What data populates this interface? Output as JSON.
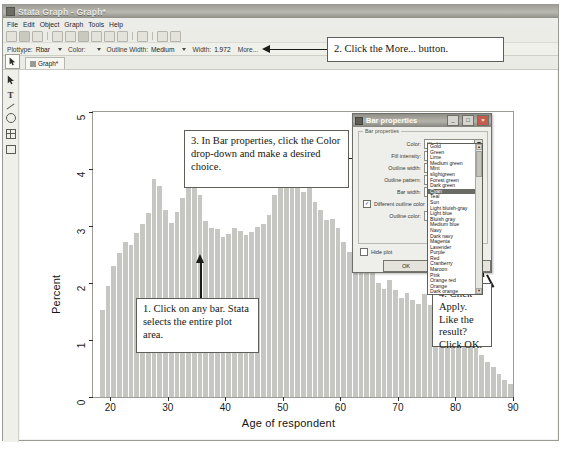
{
  "window": {
    "title": "Stata Graph - Graph*",
    "menu": [
      "File",
      "Edit",
      "Object",
      "Graph",
      "Tools",
      "Help"
    ],
    "tab_label": "Graph*",
    "pointer_icon": "arrow-cursor-icon",
    "left_tools": [
      "pointer-tool",
      "text-tool",
      "line-tool",
      "rect-tool",
      "ellipse-tool",
      "grid-tool"
    ]
  },
  "propbar": {
    "plottype_label": "Plottype:",
    "plottype_value": "Rbar",
    "color_label": "Color:",
    "color_value": "",
    "outline_width_label": "Outline Width:",
    "outline_width_value": "Medium",
    "width_label": "Width:",
    "width_value": "1.972",
    "more_label": "More..."
  },
  "chart_data": {
    "type": "bar",
    "title": "",
    "xlabel": "Age of respondent",
    "ylabel": "Percent",
    "xlim": [
      17,
      90
    ],
    "ylim": [
      0,
      5
    ],
    "xticks": [
      20,
      30,
      40,
      50,
      60,
      70,
      80,
      90
    ],
    "yticks": [
      0,
      1,
      2,
      3,
      4,
      5
    ],
    "grid": false,
    "legend": "none",
    "bar_color": "#c6c6c2",
    "x_start": 18,
    "bin_width": 1,
    "values": [
      1.52,
      1.95,
      2.3,
      2.52,
      2.72,
      2.66,
      2.88,
      3.03,
      3.23,
      3.82,
      3.7,
      3.28,
      3.05,
      3.24,
      3.5,
      3.95,
      4.11,
      3.55,
      3.08,
      2.96,
      2.95,
      2.8,
      2.86,
      2.96,
      2.92,
      2.85,
      2.9,
      2.98,
      3.04,
      3.2,
      3.55,
      4.22,
      4.58,
      4.16,
      3.8,
      3.6,
      3.72,
      3.42,
      3.28,
      3.1,
      3.12,
      2.96,
      2.72,
      2.55,
      2.7,
      2.52,
      2.3,
      2.18,
      2.0,
      1.9,
      2.05,
      1.88,
      1.74,
      1.82,
      1.7,
      1.64,
      1.8,
      1.62,
      1.5,
      1.42,
      1.4,
      1.22,
      1.1,
      1.04,
      0.92,
      0.86,
      0.74,
      0.62,
      0.52,
      0.4,
      0.3,
      0.22
    ]
  },
  "callouts": [
    {
      "id": "callout-1",
      "text": "1. Click on any bar. Stata selects the entire plot area."
    },
    {
      "id": "callout-2",
      "text": "2. Click the More... button."
    },
    {
      "id": "callout-3",
      "text": "3. In Bar properties, click the Color drop-down and make a desired choice."
    },
    {
      "id": "callout-4",
      "text": "4. Click Apply. Like the result? Click OK."
    }
  ],
  "dialog": {
    "title": "Bar properties",
    "group_caption": "Bar properties",
    "fields": [
      {
        "label": "Color:",
        "value": "Khaki"
      },
      {
        "label": "Fill intensity:",
        "value": ""
      },
      {
        "label": "Outline width:",
        "value": ""
      },
      {
        "label": "Outline pattern:",
        "value": ""
      },
      {
        "label": "Bar width:",
        "value": ""
      },
      {
        "label": "Outline color:",
        "value": ""
      }
    ],
    "different_outline_color": {
      "label": "Different outline color",
      "checked": true,
      "mark": "✓"
    },
    "hide_plot": {
      "label": "Hide plot",
      "checked": false
    },
    "buttons": {
      "ok": "OK",
      "apply": "Apply"
    },
    "window_buttons": {
      "minimize": "_",
      "maximize": "□",
      "close": "×"
    },
    "color_dropdown": {
      "selected": "Cyan",
      "options": [
        "Gold",
        "Green",
        "Lime",
        "Medium green",
        "Mint",
        "slightgreen",
        "Forest green",
        "Dark green",
        "Cyan",
        "Teal",
        "Sun",
        "Light bluish-gray",
        "Light blue",
        "Bluish gray",
        "Medium blue",
        "Navy",
        "Dark navy",
        "Magenta",
        "Lavender",
        "Purple",
        "Red",
        "Cranberry",
        "Maroon",
        "Pink",
        "Orange red",
        "Orange",
        "Dark orange",
        "Sienna",
        "Brown",
        "Gray"
      ],
      "scroll_up": "▲",
      "scroll_down": "▼"
    }
  }
}
